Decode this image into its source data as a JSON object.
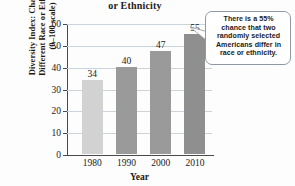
{
  "chart_data": {
    "type": "bar",
    "title": "or Ethnicity",
    "categories": [
      "1980",
      "1990",
      "2000",
      "2010"
    ],
    "values": [
      34,
      40,
      47,
      55
    ],
    "xlabel": "Year",
    "ylabel_line1": "Diversity Index: Chance of",
    "ylabel_line2": "Different Race or Ethnicity",
    "ylabel_line3": "(0–100 scale)",
    "ylim": [
      0,
      60
    ],
    "yticks": [
      60,
      50,
      40,
      30,
      20,
      10,
      0
    ],
    "grid": true,
    "legend": "none",
    "bar_colors": [
      "#d2d2d2",
      "#9a9a9a",
      "#9a9a9a",
      "#8f8f8f"
    ],
    "annotation": "There is a 55% chance that two randomly selected Americans differ in race or ethnicity."
  },
  "callout": {
    "line1": "There is a 55%",
    "line2": "chance that two",
    "line3": "randomly selected",
    "line4": "Americans differ in",
    "line5": "race or ethnicity."
  },
  "colors": {
    "grid": "#c9d4de",
    "axis": "#4a4a4a",
    "bar_light": "#d2d2d2",
    "bar_dark": "#9a9a9a",
    "callout_border": "#8d9aa6",
    "text": "#1a1a1a"
  }
}
